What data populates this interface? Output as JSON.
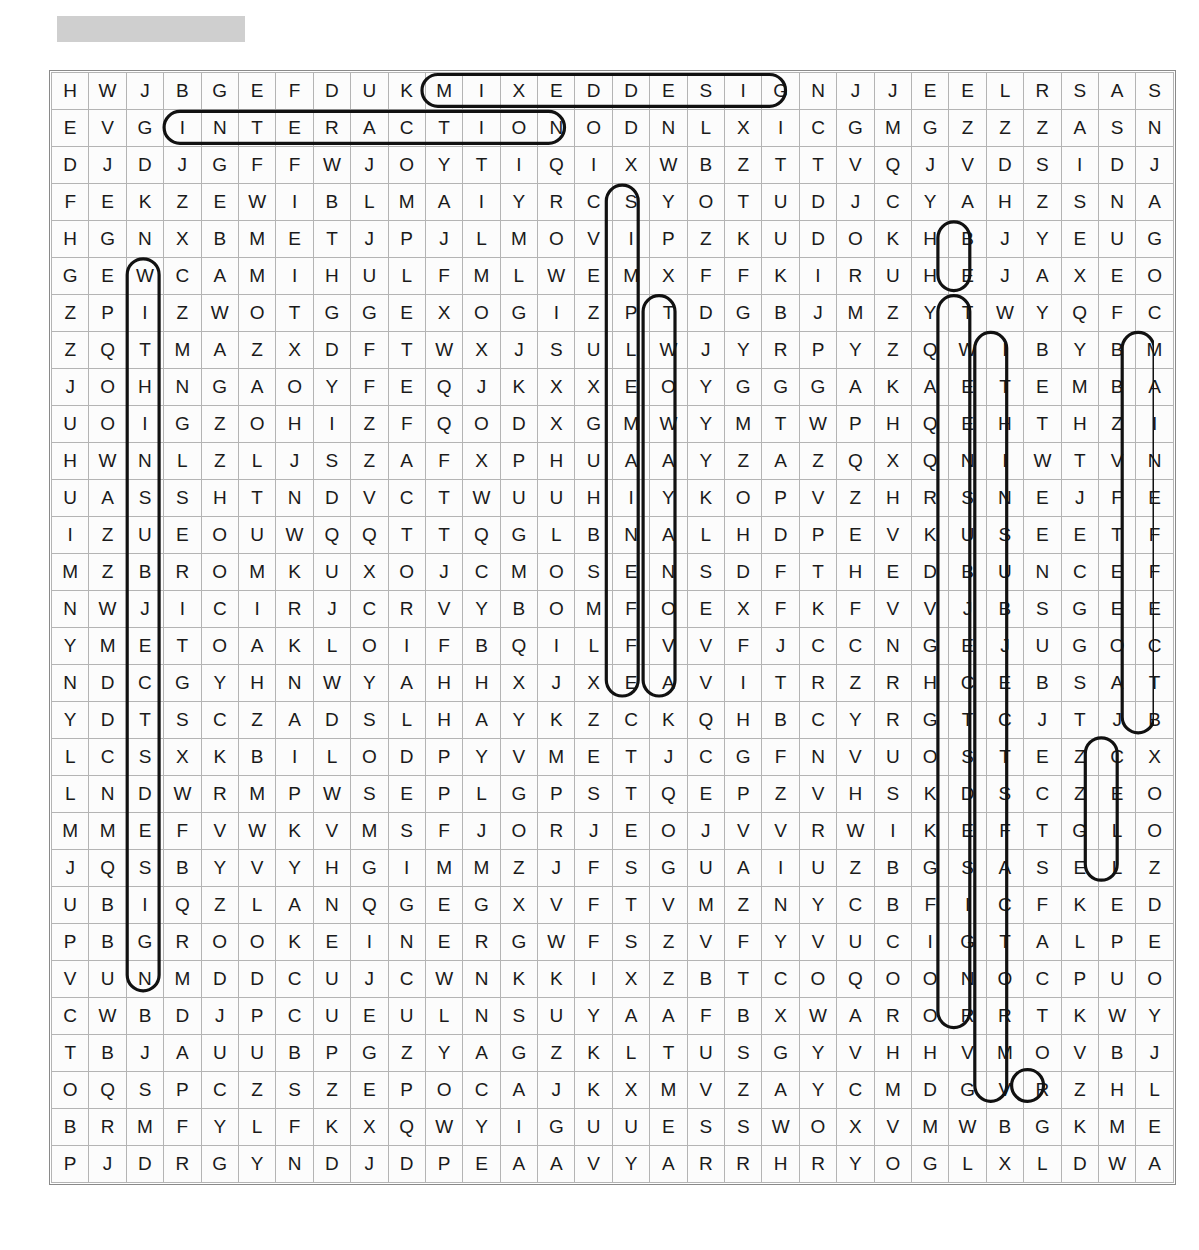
{
  "page": {
    "type": "word-search-puzzle",
    "title_bar": {
      "label": "",
      "redacted": true,
      "color": "#cfcfcf"
    }
  },
  "grid": {
    "rows": 30,
    "cols": 30,
    "cell_size_px": 36,
    "border_color": "#b4b4b4",
    "letters": [
      "HWJBGEFDUKMIXEDDESIGNJJEELRSAS",
      "EVGINTERACTIONODNLXICGMGZZZASN",
      "DJDJGFFWJOYTIQIXWBZTTVQJVDSIDJ",
      "FEKZEWIBLMAIYRCSYOTUDJCYAHZSNA",
      "HGNXBMETJPJLMOVIPZKUDOKHBJYEUG",
      "GEWCAMIHULFMLWEMXFFKIRUHEJAXEO",
      "ZPIZWOTGGEXOGIZPTDGBJMZYTWYQFC",
      "ZQTMAZXDFTWXJSULWJYRPYZQWIBYBM",
      "JOHNGAOYFEQJKXXEOYGGGAKAETEMBA",
      "UOIGZOHIZFQODXGMWYMTWPHQEHTHZI",
      "HWNLZLJSZAFXPHUAAYZAZQXQNIWTVN",
      "UASSHTNDVCTWUUHIYKOPVZHRSNEJFE",
      "IZUEOUWQQTTQGLBNALHDPEVKUSEETF",
      "MZBROMKUXOJCMOSENSDFTHEDBUNCEF",
      "NWJICIRJCRVYBOMFOEXFKFVVJBSGEE",
      "YMETOAKLOIFBQILFVVFJCCNGEJUGOC",
      "NDCGYHNWYAHHXJXEAVITRZRHCEBSAT",
      "YDTSCZADSLHAYKZCKQHBCYRGTCJTJB",
      "LCSXKBILODPYVMETJCGFNVUOSTEZCX",
      "LNDWRMPWSEPLGPSTQEPZVHSKDSCZEO",
      "MMEFVWKVMSFJORJEOJVVRWIKEFTGLO",
      "JQSBYVYHGIMMZJFSGUAIUZBGSASELZ",
      "UBIQZLANQGEGXVFTVMZNYCBFICFKED",
      "PBGROOKEINERGWFSZVFYVUCIGTALPE",
      "VUNMDDCUJCWNKKIXZBTCOQOONOCPUO",
      "CWBDJPCUEULNSUYAAFBXWARORRTKWY",
      "TBJAUUBPGZYAGZKLTUSGYVHHVMOVBJ",
      "OQSPCZSZEPOCAJKXMVZAYCMDGVRZHL",
      "BRMFYLFKXQWYIGUUESSWOXVMWBGKME",
      "PJDRGYNDJDPEAAVYARRHRYOGLXLDWA"
    ]
  },
  "found_words": [
    {
      "text": "MIXED DESIGN",
      "direction": "horizontal",
      "start_row": 0,
      "start_col": 10,
      "end_row": 0,
      "end_col": 19
    },
    {
      "text": "INTERACTION",
      "direction": "horizontal",
      "start_row": 1,
      "start_col": 3,
      "end_row": 1,
      "end_col": 13
    },
    {
      "text": "WITHIN SUBJECTS DESIGN",
      "direction": "vertical",
      "start_row": 5,
      "start_col": 2,
      "end_row": 24,
      "end_col": 2
    },
    {
      "text": "SIMULTANEOUS",
      "direction": "vertical",
      "start_row": 3,
      "start_col": 15,
      "end_row": 16,
      "end_col": 15
    },
    {
      "text": "TWO WAY",
      "direction": "vertical",
      "start_row": 6,
      "start_col": 16,
      "end_row": 16,
      "end_col": 16
    },
    {
      "text": "WITHIN SUBJECTS FACTOR",
      "direction": "vertical",
      "start_row": 6,
      "start_col": 24,
      "end_row": 25,
      "end_col": 24
    },
    {
      "text": "BETWEEN SUBJECTS",
      "direction": "vertical",
      "start_row": 7,
      "start_col": 25,
      "end_row": 27,
      "end_col": 25
    },
    {
      "text": "MAIN EFFECT",
      "direction": "vertical",
      "start_row": 7,
      "start_col": 29,
      "end_row": 17,
      "end_col": 29
    },
    {
      "text": "CELL",
      "direction": "vertical",
      "start_row": 18,
      "start_col": 28,
      "end_row": 21,
      "end_col": 28
    },
    {
      "text": "BJ",
      "direction": "vertical",
      "start_row": 4,
      "start_col": 24,
      "end_row": 5,
      "end_col": 24
    },
    {
      "text": "R",
      "direction": "single",
      "start_row": 27,
      "start_col": 26,
      "end_row": 27,
      "end_col": 26
    }
  ],
  "outline_style": {
    "stroke": "#111111",
    "stroke_width": 3.2,
    "fill": "none",
    "shape": "rounded-capsule"
  }
}
